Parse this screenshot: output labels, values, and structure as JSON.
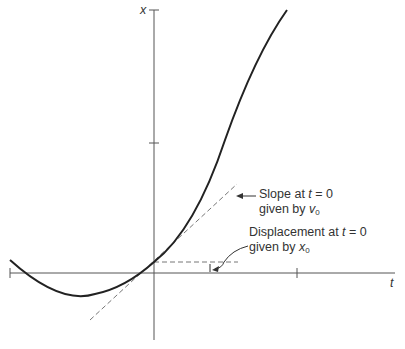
{
  "axes": {
    "y_label": "x",
    "x_label": "t"
  },
  "annotations": {
    "slope": {
      "line1_prefix": "Slope at ",
      "line1_var": "t",
      "line1_suffix": " = 0",
      "line2_prefix": "given by ",
      "line2_var": "v",
      "line2_sub": "0"
    },
    "displacement": {
      "line1_prefix": "Displacement at ",
      "line1_var": "t",
      "line1_suffix": " = 0",
      "line2_prefix": "given by ",
      "line2_var": "x",
      "line2_sub": "0"
    }
  },
  "colors": {
    "curve": "#222222",
    "axis": "#555555",
    "dashed": "#777777",
    "text": "#333333"
  }
}
